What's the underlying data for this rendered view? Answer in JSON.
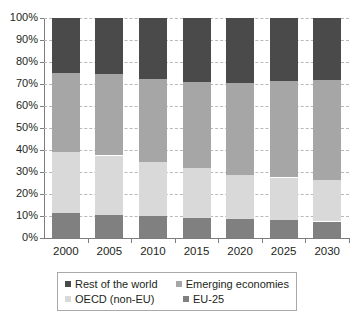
{
  "chart_data": {
    "type": "bar",
    "subtype": "stacked-bar-100-percent",
    "title": "",
    "subtitle": "",
    "xlabel": "",
    "ylabel": "",
    "categories": [
      "2000",
      "2005",
      "2010",
      "2015",
      "2020",
      "2025",
      "2030"
    ],
    "ylim": [
      0,
      100
    ],
    "ytick_labels": [
      "0%",
      "10%",
      "20%",
      "30%",
      "40%",
      "50%",
      "60%",
      "70%",
      "80%",
      "90%",
      "100%"
    ],
    "ytick_values": [
      0,
      10,
      20,
      30,
      40,
      50,
      60,
      70,
      80,
      90,
      100
    ],
    "grid": true,
    "grid_style": "dashed-horizontal",
    "legend_position": "bottom",
    "stack_order_bottom_to_top": [
      "EU-25",
      "OECD (non-EU)",
      "Emerging economies",
      "Rest of the world"
    ],
    "series": [
      {
        "name": "EU-25",
        "color": "#808080",
        "values": [
          11.5,
          10.5,
          10.0,
          9.0,
          8.5,
          8.0,
          7.5
        ]
      },
      {
        "name": "OECD (non-EU)",
        "color": "#d9d9d9",
        "values": [
          27.5,
          27.0,
          24.5,
          23.0,
          20.0,
          19.5,
          19.0
        ]
      },
      {
        "name": "Emerging economies",
        "color": "#a6a6a6",
        "values": [
          36.0,
          37.0,
          38.0,
          39.0,
          42.0,
          44.0,
          45.5
        ]
      },
      {
        "name": "Rest of the world",
        "color": "#4a4a4a",
        "values": [
          25.0,
          25.5,
          27.5,
          29.0,
          29.5,
          28.5,
          28.0
        ]
      }
    ]
  },
  "legend": {
    "entries": [
      {
        "label": "Rest of the world",
        "color": "#4a4a4a"
      },
      {
        "label": "Emerging economies",
        "color": "#a6a6a6"
      },
      {
        "label": "OECD (non-EU)",
        "color": "#d9d9d9"
      },
      {
        "label": "EU-25",
        "color": "#808080"
      }
    ]
  },
  "axis_colors": {
    "axis_line": "#7d7d7d",
    "gridline": "#b9b9b9",
    "text": "#231f20",
    "legend_border": "#a9a9a9"
  }
}
